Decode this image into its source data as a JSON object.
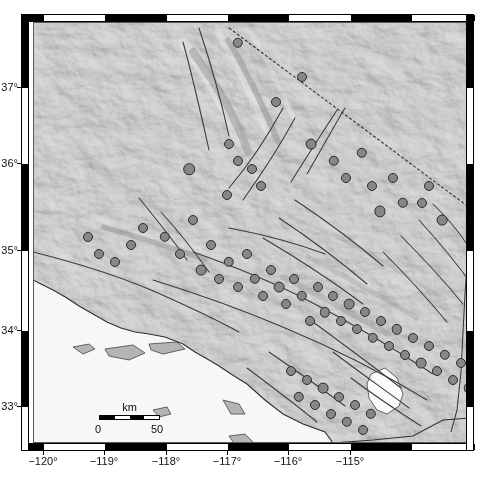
{
  "figure": {
    "type": "map",
    "projection": "geographic",
    "background_basemap": "shaded-relief-grayscale"
  },
  "axes": {
    "x": {
      "label": "",
      "unit": "degrees longitude",
      "range": [
        -120.3,
        -114.85
      ],
      "ticks": [
        -120,
        -119,
        -118,
        -117,
        -116,
        -115
      ],
      "tick_labels": [
        "−120°",
        "−119°",
        "−118°",
        "−117°",
        "−116°",
        "−115°"
      ],
      "tick_px": [
        43,
        104,
        166,
        227,
        288,
        350,
        411,
        470
      ]
    },
    "y": {
      "label": "",
      "unit": "degrees latitude",
      "range": [
        32.55,
        37.55
      ],
      "ticks": [
        37,
        36,
        35,
        34,
        33
      ],
      "tick_labels": [
        "37°",
        "36°",
        "35°",
        "34°",
        "33°"
      ],
      "tick_px": [
        87,
        163,
        250,
        330,
        406
      ]
    }
  },
  "scalebar": {
    "unit_label": "km",
    "min_label": "0",
    "max_label": "50",
    "length_km": 50,
    "segments": 4
  },
  "legend": {
    "symbol_name": "earthquake-epicenter-circle",
    "symbol_fill": "#878787",
    "symbol_stroke": "#2b2b2b"
  },
  "colors": {
    "land": "#c9c9c9",
    "ocean": "#f6f6f6",
    "fault_line": "#3a3a3a",
    "frame": "#000000",
    "tick_text": "#111111",
    "lake": "#fbfbfb"
  },
  "map_features": {
    "lakes": [
      "Salton Sea"
    ],
    "islands": [
      "Santa Cruz Island",
      "Santa Rosa Island",
      "San Miguel Island",
      "Anacapa Island",
      "Santa Catalina Island",
      "San Clemente Island",
      "San Nicolas Island"
    ],
    "borders": [
      "California-Nevada state line"
    ],
    "fault_systems": [
      "San Andreas",
      "Garlock",
      "San Jacinto",
      "Elsinore",
      "Sierra Nevada frontal"
    ]
  },
  "chart_data": {
    "type": "scatter",
    "xlabel": "Longitude",
    "ylabel": "Latitude",
    "xlim": [
      -120.3,
      -114.85
    ],
    "ylim": [
      32.55,
      37.55
    ],
    "grid": false,
    "legend_position": "none",
    "series": [
      {
        "name": "Earthquake epicenters",
        "marker": "circle",
        "fill": "#878787",
        "stroke": "#2b2b2b",
        "points": [
          [
            205,
            37.3,
            5.2
          ],
          [
            243,
            36.6,
            5.0
          ],
          [
            269,
            36.9,
            5.0
          ],
          [
            278,
            36.1,
            5.4
          ],
          [
            196,
            36.1,
            5.0
          ],
          [
            205,
            35.9,
            5.0
          ],
          [
            156,
            35.8,
            5.8
          ],
          [
            219,
            35.8,
            5.0
          ],
          [
            228,
            35.6,
            5.0
          ],
          [
            194,
            35.5,
            5.0
          ],
          [
            301,
            35.9,
            5.2
          ],
          [
            313,
            35.7,
            5.0
          ],
          [
            329,
            36.0,
            5.2
          ],
          [
            339,
            35.6,
            5.0
          ],
          [
            347,
            35.3,
            5.6
          ],
          [
            360,
            35.7,
            5.0
          ],
          [
            370,
            35.4,
            5.2
          ],
          [
            389,
            35.4,
            5.0
          ],
          [
            396,
            35.6,
            5.0
          ],
          [
            409,
            35.2,
            5.4
          ],
          [
            55,
            35.0,
            5.0
          ],
          [
            66,
            34.8,
            5.0
          ],
          [
            82,
            34.7,
            5.0
          ],
          [
            98,
            34.9,
            5.0
          ],
          [
            110,
            35.1,
            5.0
          ],
          [
            132,
            35.0,
            5.2
          ],
          [
            147,
            34.8,
            5.0
          ],
          [
            160,
            35.2,
            5.0
          ],
          [
            168,
            34.6,
            5.4
          ],
          [
            178,
            34.9,
            5.0
          ],
          [
            186,
            34.5,
            5.0
          ],
          [
            196,
            34.7,
            5.2
          ],
          [
            205,
            34.4,
            5.0
          ],
          [
            214,
            34.8,
            5.0
          ],
          [
            222,
            34.5,
            5.2
          ],
          [
            230,
            34.3,
            5.0
          ],
          [
            238,
            34.6,
            5.0
          ],
          [
            246,
            34.4,
            5.4
          ],
          [
            253,
            34.2,
            5.0
          ],
          [
            261,
            34.5,
            5.0
          ],
          [
            269,
            34.3,
            5.2
          ],
          [
            277,
            34.0,
            5.0
          ],
          [
            285,
            34.4,
            5.0
          ],
          [
            292,
            34.1,
            5.2
          ],
          [
            300,
            34.3,
            5.0
          ],
          [
            308,
            34.0,
            5.0
          ],
          [
            316,
            34.2,
            5.4
          ],
          [
            324,
            33.9,
            5.0
          ],
          [
            332,
            34.1,
            5.0
          ],
          [
            340,
            33.8,
            5.2
          ],
          [
            348,
            34.0,
            5.0
          ],
          [
            356,
            33.7,
            5.0
          ],
          [
            364,
            33.9,
            5.2
          ],
          [
            372,
            33.6,
            5.0
          ],
          [
            380,
            33.8,
            5.0
          ],
          [
            388,
            33.5,
            5.4
          ],
          [
            396,
            33.7,
            5.0
          ],
          [
            404,
            33.4,
            5.0
          ],
          [
            412,
            33.6,
            5.2
          ],
          [
            420,
            33.3,
            5.0
          ],
          [
            428,
            33.5,
            5.0
          ],
          [
            436,
            33.2,
            5.2
          ],
          [
            444,
            33.4,
            5.0
          ],
          [
            452,
            33.1,
            5.0
          ],
          [
            258,
            33.4,
            5.0
          ],
          [
            266,
            33.1,
            5.2
          ],
          [
            274,
            33.3,
            5.0
          ],
          [
            282,
            33.0,
            5.0
          ],
          [
            290,
            33.2,
            5.4
          ],
          [
            298,
            32.9,
            5.0
          ],
          [
            306,
            33.1,
            5.0
          ],
          [
            314,
            32.8,
            5.2
          ],
          [
            322,
            33.0,
            5.0
          ],
          [
            330,
            32.7,
            5.0
          ],
          [
            338,
            32.9,
            5.2
          ]
        ]
      }
    ]
  }
}
